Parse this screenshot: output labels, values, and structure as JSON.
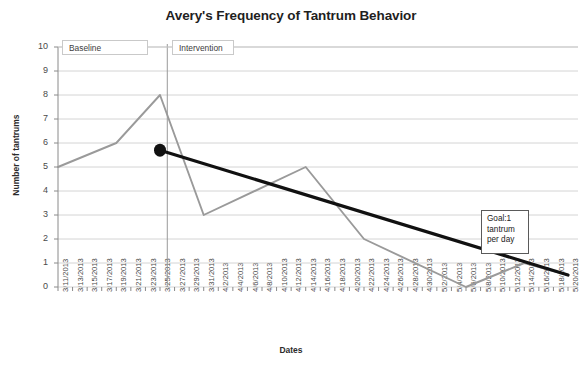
{
  "chart_data": {
    "type": "line",
    "title": "Avery's Frequency of Tantrum Behavior",
    "xlabel": "Dates",
    "ylabel": "Number of tantrums",
    "ylim": [
      0,
      10
    ],
    "yticks": [
      "0",
      "1",
      "2",
      "3",
      "4",
      "5",
      "6",
      "7",
      "8",
      "9",
      "10"
    ],
    "grid": true,
    "legend": "none",
    "categories": [
      "3/11/2013",
      "3/13/2013",
      "3/15/2013",
      "3/17/2013",
      "3/19/2013",
      "3/21/2013",
      "3/23/2013",
      "3/25/2013",
      "3/27/2013",
      "3/29/2013",
      "3/31/2013",
      "4/2/2013",
      "4/4/2013",
      "4/6/2013",
      "4/8/2013",
      "4/10/2013",
      "4/12/2013",
      "4/14/2013",
      "4/16/2013",
      "4/18/2013",
      "4/20/2013",
      "4/22/2013",
      "4/24/2013",
      "4/26/2013",
      "4/28/2013",
      "4/30/2013",
      "5/2/2013",
      "5/4/2013",
      "5/6/2013",
      "5/8/2013",
      "5/10/2013",
      "5/12/2013",
      "5/14/2013",
      "5/16/2013",
      "5/18/2013",
      "5/20/2013"
    ],
    "series": [
      {
        "name": "Tantrum frequency",
        "color": "#9a9a9a",
        "points": [
          {
            "x": "3/11/2013",
            "y": 5
          },
          {
            "x": "3/19/2013",
            "y": 6
          },
          {
            "x": "3/25/2013",
            "y": 8
          },
          {
            "x": "3/31/2013",
            "y": 3
          },
          {
            "x": "4/14/2013",
            "y": 5
          },
          {
            "x": "4/22/2013",
            "y": 2
          },
          {
            "x": "5/6/2013",
            "y": 0
          },
          {
            "x": "5/14/2013",
            "y": 1
          },
          {
            "x": "5/20/2013",
            "y": 0.5
          }
        ]
      },
      {
        "name": "Goal trend line",
        "color": "#111111",
        "points": [
          {
            "x": "3/25/2013",
            "y": 5.7
          },
          {
            "x": "5/20/2013",
            "y": 0.5
          }
        ],
        "marker": "filled-circle-at-start"
      }
    ],
    "phase_change_line": {
      "at": "3/26/2013",
      "color": "#9a9a9a"
    },
    "annotations": [
      {
        "name": "baseline-phase-label",
        "text": "Baseline"
      },
      {
        "name": "intervention-phase-label",
        "text": "Intervention"
      },
      {
        "name": "goal-annotation",
        "text": "Goal:1\ntantrum\nper day"
      }
    ]
  },
  "chart": {
    "title": "Avery's Frequency of Tantrum Behavior",
    "ylabel": "Number of tantrums",
    "xlabel": "Dates",
    "baseline_label": "Baseline",
    "intervention_label": "Intervention",
    "goal_label": "Goal:1\ntantrum\nper day"
  }
}
